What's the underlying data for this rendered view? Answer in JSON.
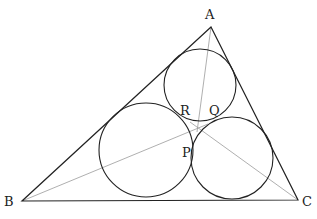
{
  "diagram": {
    "colors": {
      "stroke": "#222222",
      "cevian": "#9a9a9a",
      "background": "#ffffff"
    },
    "vertices": {
      "A": {
        "label": "A",
        "x": 211,
        "y": 27,
        "lx": 205,
        "ly": 19
      },
      "B": {
        "label": "B",
        "x": 22,
        "y": 201,
        "lx": 4,
        "ly": 206
      },
      "C": {
        "label": "C",
        "x": 298,
        "y": 200,
        "lx": 302,
        "ly": 206
      }
    },
    "circles": [
      {
        "name": "top-circle",
        "cx": 200,
        "cy": 85,
        "r": 36
      },
      {
        "name": "left-circle",
        "cx": 146,
        "cy": 150,
        "r": 47
      },
      {
        "name": "right-circle",
        "cx": 232,
        "cy": 158,
        "r": 41
      }
    ],
    "tangent_points": {
      "R": {
        "label": "R",
        "lx": 180,
        "ly": 115
      },
      "Q": {
        "label": "Q",
        "lx": 209,
        "ly": 115
      },
      "P": {
        "label": "P",
        "lx": 182,
        "ly": 157
      }
    },
    "cevian_meet": {
      "x": 199,
      "y": 127
    }
  }
}
